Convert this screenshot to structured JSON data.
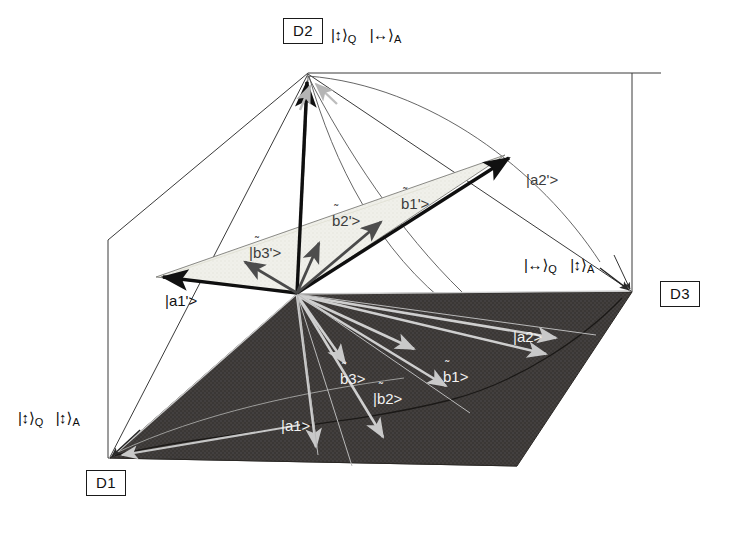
{
  "figure": {
    "background": "#ffffff",
    "dark_plane_color": "#3a3735",
    "light_plane_color": "#efefe9",
    "line_color": "#1a1a1a",
    "gray_vector_color": "#4d4d4d",
    "pale_vector_color": "#b5b5b5",
    "white_vector_color": "#d8d8d8"
  },
  "detectors": [
    {
      "id": "D1",
      "label": "D1",
      "x": 86,
      "y": 470
    },
    {
      "id": "D2",
      "label": "D2",
      "x": 283,
      "y": 18
    },
    {
      "id": "D3",
      "label": "D3",
      "x": 660,
      "y": 281
    }
  ],
  "basis_labels": [
    {
      "id": "d2-state",
      "detector": "D2",
      "text": "|↕⟩_Q |↔⟩_A",
      "parts": [
        {
          "bra": "|",
          "arrow": "↕",
          "ket": "⟩",
          "sub": "Q"
        },
        {
          "bra": "|",
          "arrow": "↔",
          "ket": "⟩",
          "sub": "A"
        }
      ],
      "x": 331,
      "y": 27
    },
    {
      "id": "d3-state",
      "detector": "D3",
      "text": "|↔⟩_Q |↕⟩_A",
      "parts": [
        {
          "bra": "|",
          "arrow": "↔",
          "ket": "⟩",
          "sub": "Q"
        },
        {
          "bra": "|",
          "arrow": "↕",
          "ket": "⟩",
          "sub": "A"
        }
      ],
      "x": 524,
      "y": 257
    },
    {
      "id": "d1-state",
      "detector": "D1",
      "text": "|↕⟩_Q |↕⟩_A",
      "parts": [
        {
          "bra": "|",
          "arrow": "↕",
          "ket": "⟩",
          "sub": "Q"
        },
        {
          "bra": "|",
          "arrow": "↕",
          "ket": "⟩",
          "sub": "A"
        }
      ],
      "x": 18,
      "y": 410
    }
  ],
  "upper_plane_vectors": [
    {
      "id": "a1p",
      "label": "|a1'>",
      "base": "a1'",
      "tilde": false,
      "tone": "dark",
      "x": 165,
      "y": 293
    },
    {
      "id": "b3p",
      "label": "|b3'>",
      "base": "b3'",
      "tilde": true,
      "tone": "dark",
      "x": 249,
      "y": 245
    },
    {
      "id": "b2p",
      "label": "|b2'>",
      "base": "b2'",
      "tilde": true,
      "tone": "dark",
      "x": 332,
      "y": 213
    },
    {
      "id": "b1p",
      "label": "|b1'>",
      "base": "b1'",
      "tilde": true,
      "tone": "dark",
      "x": 401,
      "y": 196
    },
    {
      "id": "a2p",
      "label": "|a2'>",
      "base": "a2'",
      "tilde": false,
      "tone": "dark",
      "x": 526,
      "y": 172
    }
  ],
  "lower_plane_vectors": [
    {
      "id": "a1",
      "label": "|a1>",
      "base": "a1",
      "tilde": false,
      "tone": "light",
      "x": 281,
      "y": 418
    },
    {
      "id": "b3",
      "label": "|b3>",
      "base": "b3",
      "tilde": true,
      "tone": "light",
      "x": 340,
      "y": 371
    },
    {
      "id": "b2",
      "label": "|b2>",
      "base": "b2",
      "tilde": true,
      "tone": "light",
      "x": 373,
      "y": 391
    },
    {
      "id": "b1",
      "label": "|b1>",
      "base": "b1",
      "tilde": true,
      "tone": "light",
      "x": 443,
      "y": 369
    },
    {
      "id": "a2",
      "label": "|a2>",
      "base": "a2",
      "tilde": false,
      "tone": "light",
      "x": 513,
      "y": 329
    }
  ],
  "geometry": {
    "origin": {
      "x": 297,
      "y": 293
    },
    "apex_d2": {
      "x": 308,
      "y": 74
    },
    "corner_d1": {
      "x": 110,
      "y": 458
    },
    "corner_d3": {
      "x": 632,
      "y": 292
    },
    "upper_tip_a1": {
      "x": 156,
      "y": 277
    },
    "upper_tip_a2": {
      "x": 505,
      "y": 155
    }
  }
}
